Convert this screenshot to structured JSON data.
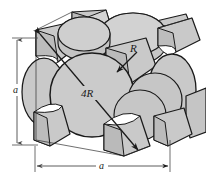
{
  "figure": {
    "type": "fcc-unit-cell-hard-sphere-model",
    "background_color": "#ffffff",
    "sphere_fill_color": "#c9c9c9",
    "sphere_fill_light": "#d8d8d8",
    "sphere_fill_dark": "#b4b4b4",
    "outline_color": "#1a1a1a",
    "dimension_line_color": "#4a4a4a"
  },
  "labels": {
    "edge_vertical": "a",
    "edge_horizontal": "a",
    "face_diagonal": "4R",
    "radius": "R"
  },
  "dimensions": {
    "vertical": {
      "label": "a",
      "arrow_top": "up-arrow",
      "arrow_bottom": "down-arrow"
    },
    "horizontal": {
      "label": "a",
      "arrow_left": "left-arrow",
      "arrow_right": "right-arrow"
    }
  },
  "annotations": {
    "diagonal_line": {
      "label": "4R",
      "description": "face diagonal spanning four atomic radii",
      "arrow_start": "upper-left",
      "arrow_end": "lower-right"
    },
    "radius_leader": {
      "label": "R",
      "description": "atomic radius leader arrow",
      "arrow_direction": "down-left"
    }
  },
  "atoms": {
    "corner_count": 8,
    "face_count": 6,
    "corner_shape": "one-eighth-sphere-wedge",
    "face_shape": "half-sphere"
  }
}
